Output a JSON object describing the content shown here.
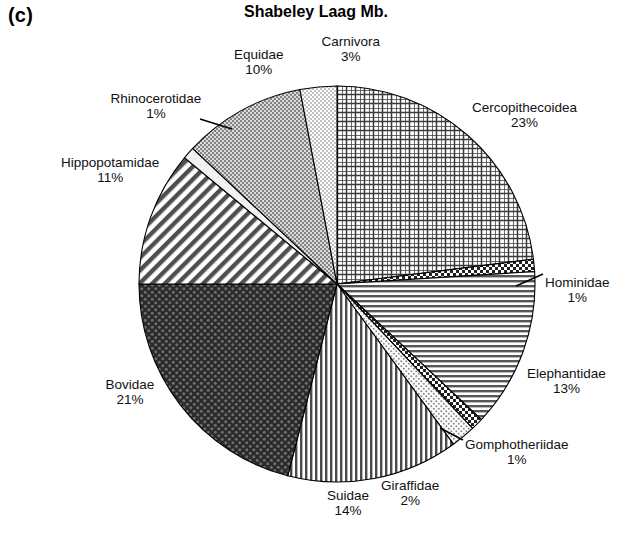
{
  "panel": {
    "label": "(c)"
  },
  "chart_data": {
    "type": "pie",
    "title": "Shabeley Laag Mb.",
    "xlabel": "",
    "ylabel": "",
    "legend": "none",
    "grid": false,
    "units": "percent",
    "start_angle_deg": 0,
    "direction": "clockwise",
    "categories": [
      "Cercopithecoidea",
      "Hominidae",
      "Elephantidae",
      "Gomphotheriidae",
      "Giraffidae",
      "Suidae",
      "Bovidae",
      "Hippopotamidae",
      "Rhinocerotidae",
      "Equidae",
      "Carnivora"
    ],
    "values": [
      23,
      1,
      13,
      1,
      2,
      14,
      21,
      11,
      1,
      10,
      3
    ],
    "value_labels": [
      "23%",
      "1%",
      "13%",
      "1%",
      "2%",
      "14%",
      "21%",
      "11%",
      "1%",
      "10%",
      "3%"
    ],
    "slices": [
      {
        "name": "Cercopithecoidea",
        "value": 23,
        "label": "Cercopithecoidea",
        "pct": "23%",
        "pattern": "grid-cross-hatch",
        "color": "#3a3a3a",
        "leader": false
      },
      {
        "name": "Hominidae",
        "value": 1,
        "label": "Hominidae",
        "pct": "1%",
        "pattern": "checker-dark",
        "color": "#2b2b2b",
        "leader": true
      },
      {
        "name": "Elephantidae",
        "value": 13,
        "label": "Elephantidae",
        "pct": "13%",
        "pattern": "horizontal-lines",
        "color": "#555555",
        "leader": false
      },
      {
        "name": "Gomphotheriidae",
        "value": 1,
        "label": "Gomphotheriidae",
        "pct": "1%",
        "pattern": "checker-dark",
        "color": "#2b2b2b",
        "leader": true
      },
      {
        "name": "Giraffidae",
        "value": 2,
        "label": "Giraffidae",
        "pct": "2%",
        "pattern": "fine-dots-light",
        "color": "#9a9a9a",
        "leader": false
      },
      {
        "name": "Suidae",
        "value": 14,
        "label": "Suidae",
        "pct": "14%",
        "pattern": "vertical-lines",
        "color": "#4a4a4a",
        "leader": false
      },
      {
        "name": "Bovidae",
        "value": 21,
        "label": "Bovidae",
        "pct": "21%",
        "pattern": "checker-very-dark",
        "color": "#2e2e2e",
        "leader": false
      },
      {
        "name": "Hippopotamidae",
        "value": 11,
        "label": "Hippopotamidae",
        "pct": "11%",
        "pattern": "diagonal-lines",
        "color": "#4f4f4f",
        "leader": false
      },
      {
        "name": "Rhinocerotidae",
        "value": 1,
        "label": "Rhinocerotidae",
        "pct": "1%",
        "pattern": "light-blank",
        "color": "#e8e8e8",
        "leader": true
      },
      {
        "name": "Equidae",
        "value": 10,
        "label": "Equidae",
        "pct": "10%",
        "pattern": "stipple-medium",
        "color": "#8f8f8f",
        "leader": false
      },
      {
        "name": "Carnivora",
        "value": 3,
        "label": "Carnivora",
        "pct": "3%",
        "pattern": "stipple-light-vertical",
        "color": "#b5b5b5",
        "leader": false
      }
    ]
  }
}
